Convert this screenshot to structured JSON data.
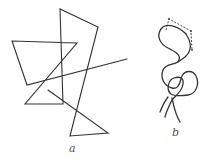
{
  "figure": {
    "background": "#ffffff",
    "stroke_color": "#333333",
    "label_color": "#555555",
    "panels": [
      {
        "id": "a",
        "label": "a",
        "description": "Random-walk polyline of straight segments (freely jointed chain)",
        "polyline": [
          [
            127,
            59
          ],
          [
            27,
            85
          ],
          [
            12,
            41
          ],
          [
            77,
            43
          ],
          [
            25,
            104
          ],
          [
            63,
            104
          ],
          [
            60,
            9
          ],
          [
            98,
            27
          ],
          [
            70,
            136
          ],
          [
            108,
            133
          ],
          [
            48,
            90
          ]
        ]
      },
      {
        "id": "b",
        "label": "b",
        "description": "Smooth wavy chain (worm-like coil) with dashed segment overlay",
        "dashed_polyline": [
          [
            166,
            30
          ],
          [
            169,
            19
          ],
          [
            191,
            31
          ],
          [
            192,
            50
          ]
        ]
      }
    ]
  }
}
